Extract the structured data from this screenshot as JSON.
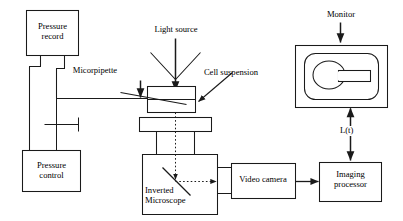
{
  "figure": {
    "stroke_color": "#1a1a1a",
    "fill_color": "#ffffff",
    "background": "#ffffff"
  },
  "boxes": {
    "pressure_record": "Pressure\nrecord",
    "pressure_control": "Pressure\ncontrol",
    "inverted_microscope": "Inverted\nMicroscope",
    "video_camera": "Video camera",
    "imaging_processor": "Imaging\nprocessor"
  },
  "labels": {
    "light_source": "Light source",
    "micropipette": "Micorpipette",
    "cell_suspension": "Cell suspension",
    "monitor": "Monitor",
    "signal": "L(t)"
  },
  "icons": {
    "light_source_arrow": "down-arrow-icon",
    "cell_suspension_pointer": "leader-arrow-icon",
    "micropipette_pointer": "leader-line-icon",
    "monitor_arrow": "down-arrow-icon",
    "camera_arrow": "right-arrow-icon",
    "signal_arrow": "double-headed-vertical-arrow-icon",
    "mirror": "mirror-icon",
    "light_path": "dotted-light-path-icon",
    "valve": "valve-icon",
    "monitor_cell": "cell-ellipse-icon",
    "monitor_pipette": "pipette-rect-icon"
  }
}
